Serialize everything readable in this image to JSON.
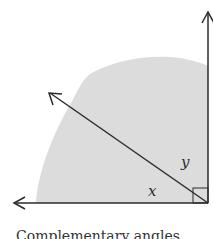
{
  "diagram": {
    "caption": "Complementary angles",
    "labels": {
      "x": "x",
      "y": "y"
    },
    "colors": {
      "line": "#2b2b2b",
      "shade": "#dcdcdc",
      "background": "#ffffff"
    }
  }
}
